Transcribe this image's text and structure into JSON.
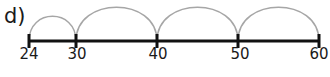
{
  "diagram": {
    "part_label": "d)",
    "type": "number-line-jumps",
    "colors": {
      "line": "#111111",
      "arc": "#a6a6a6",
      "text": "#1a1a1a"
    },
    "ticks": [
      {
        "value": 24,
        "label": "24",
        "x": 29
      },
      {
        "value": 30,
        "label": "30",
        "x": 76
      },
      {
        "value": 40,
        "label": "40",
        "x": 157
      },
      {
        "value": 50,
        "label": "50",
        "x": 238
      },
      {
        "value": 60,
        "label": "60",
        "x": 319
      }
    ],
    "jumps": [
      {
        "from": 24,
        "to": 30
      },
      {
        "from": 30,
        "to": 40
      },
      {
        "from": 40,
        "to": 50
      },
      {
        "from": 50,
        "to": 60
      }
    ]
  }
}
